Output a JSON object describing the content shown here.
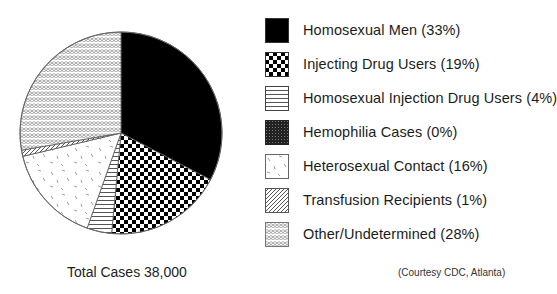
{
  "chart_data": {
    "type": "pie",
    "title": "",
    "start_angle_deg": 0,
    "direction": "clockwise from 12 o'clock",
    "slices": [
      {
        "label": "Homosexual Men",
        "value": 33,
        "pattern": "solid-black"
      },
      {
        "label": "Injecting Drug Users",
        "value": 19,
        "pattern": "checkerboard"
      },
      {
        "label": "Homosexual Injection Drug Users",
        "value": 4,
        "pattern": "horizontal-lines"
      },
      {
        "label": "Hemophilia Cases",
        "value": 0,
        "pattern": "dark-stipple"
      },
      {
        "label": "Heterosexual Contact",
        "value": 16,
        "pattern": "sparse-dashes"
      },
      {
        "label": "Transfusion Recipients",
        "value": 1,
        "pattern": "diagonal-hatch"
      },
      {
        "label": "Other/Undetermined",
        "value": 28,
        "pattern": "scale-crosshatch"
      }
    ],
    "legend_position": "right",
    "total_label": "Total Cases 38,000",
    "source": "(Courtesy CDC, Atlanta)"
  },
  "legend": {
    "items": [
      {
        "label": "Homosexual Men (33%)"
      },
      {
        "label": "Injecting Drug Users (19%)"
      },
      {
        "label": "Homosexual Injection Drug Users (4%)"
      },
      {
        "label": "Hemophilia Cases (0%)"
      },
      {
        "label": "Heterosexual Contact (16%)"
      },
      {
        "label": "Transfusion Recipients (1%)"
      },
      {
        "label": "Other/Undetermined (28%)"
      }
    ]
  },
  "footer": {
    "total": "Total Cases 38,000",
    "credit": "(Courtesy CDC, Atlanta)"
  }
}
